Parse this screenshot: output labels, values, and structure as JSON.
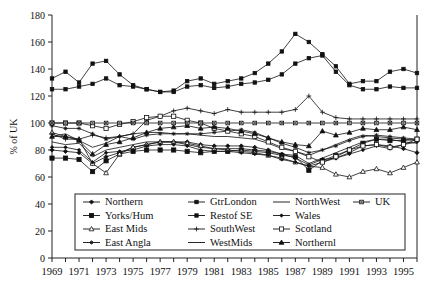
{
  "chart_data": {
    "type": "line",
    "title": "",
    "xlabel": "",
    "ylabel": "% of UK",
    "ylim": [
      0,
      180
    ],
    "ytick_step": 20,
    "yticks": [
      0,
      20,
      40,
      60,
      80,
      100,
      120,
      140,
      160,
      180
    ],
    "xlim": [
      1969,
      1996
    ],
    "xticks": [
      1969,
      1970,
      1971,
      1972,
      1973,
      1974,
      1975,
      1976,
      1977,
      1978,
      1979,
      1980,
      1981,
      1982,
      1983,
      1984,
      1985,
      1986,
      1987,
      1988,
      1989,
      1990,
      1991,
      1992,
      1993,
      1994,
      1995,
      1996
    ],
    "xtick_labels": [
      "1969",
      "",
      "1971",
      "",
      "1973",
      "",
      "1975",
      "",
      "1977",
      "",
      "1979",
      "",
      "1981",
      "",
      "1983",
      "",
      "1985",
      "",
      "1987",
      "",
      "1989",
      "",
      "1991",
      "",
      "1993",
      "",
      "1995",
      ""
    ],
    "x": [
      1969,
      1970,
      1971,
      1972,
      1973,
      1974,
      1975,
      1976,
      1977,
      1978,
      1979,
      1980,
      1981,
      1982,
      1983,
      1984,
      1985,
      1986,
      1987,
      1988,
      1989,
      1990,
      1991,
      1992,
      1993,
      1994,
      1995,
      1996
    ],
    "grid": false,
    "legend_position": "inside-bottom-center",
    "series": [
      {
        "name": "Northern",
        "marker": "diamond-filled",
        "values": [
          80,
          79,
          78,
          70,
          75,
          78,
          82,
          84,
          86,
          86,
          86,
          84,
          83,
          83,
          83,
          82,
          80,
          77,
          74,
          69,
          73,
          74,
          78,
          83,
          84,
          83,
          81,
          78
        ]
      },
      {
        "name": "Yorks/Hum",
        "marker": "square-filled",
        "values": [
          74,
          74,
          73,
          64,
          72,
          77,
          79,
          80,
          80,
          80,
          79,
          78,
          79,
          79,
          80,
          79,
          78,
          76,
          75,
          65,
          72,
          76,
          80,
          85,
          88,
          87,
          87,
          88
        ]
      },
      {
        "name": "East Mids",
        "marker": "triangle-open",
        "values": [
          93,
          90,
          88,
          70,
          63,
          77,
          82,
          84,
          86,
          86,
          85,
          83,
          81,
          80,
          79,
          78,
          76,
          74,
          71,
          68,
          67,
          62,
          60,
          64,
          66,
          63,
          67,
          71
        ]
      },
      {
        "name": "East Angla",
        "marker": "star",
        "values": [
          98,
          96,
          96,
          92,
          88,
          90,
          88,
          91,
          92,
          92,
          92,
          92,
          93,
          94,
          95,
          93,
          89,
          85,
          82,
          78,
          80,
          83,
          87,
          90,
          91,
          90,
          89,
          88
        ]
      },
      {
        "name": "GtrLondon",
        "marker": "square-filled-sm",
        "values": [
          133,
          138,
          130,
          144,
          146,
          136,
          128,
          125,
          123,
          124,
          131,
          133,
          129,
          131,
          133,
          137,
          144,
          153,
          166,
          160,
          151,
          142,
          129,
          131,
          131,
          138,
          140,
          137
        ]
      },
      {
        "name": "Restof SE",
        "marker": "square-filled-sm",
        "values": [
          125,
          125,
          127,
          129,
          133,
          128,
          127,
          125,
          123,
          123,
          127,
          128,
          126,
          127,
          129,
          130,
          132,
          136,
          144,
          148,
          150,
          138,
          128,
          125,
          125,
          127,
          126,
          126
        ]
      },
      {
        "name": "SouthWest",
        "marker": "plus",
        "values": [
          92,
          88,
          88,
          91,
          89,
          90,
          92,
          102,
          105,
          109,
          111,
          109,
          107,
          110,
          108,
          108,
          108,
          108,
          110,
          120,
          108,
          104,
          103,
          103,
          103,
          103,
          103,
          103
        ]
      },
      {
        "name": "WestMids",
        "marker": "none",
        "values": [
          90,
          92,
          87,
          82,
          85,
          90,
          92,
          93,
          93,
          92,
          92,
          91,
          90,
          90,
          89,
          88,
          85,
          81,
          79,
          76,
          80,
          84,
          88,
          91,
          90,
          89,
          88,
          87
        ]
      },
      {
        "name": "NorthWest",
        "marker": "none",
        "values": [
          86,
          84,
          85,
          75,
          80,
          82,
          84,
          86,
          86,
          86,
          84,
          82,
          81,
          81,
          81,
          80,
          79,
          77,
          76,
          70,
          74,
          78,
          82,
          86,
          88,
          88,
          86,
          85
        ]
      },
      {
        "name": "Wales",
        "marker": "diamond-filled-sm",
        "values": [
          82,
          82,
          80,
          71,
          78,
          79,
          80,
          83,
          84,
          84,
          83,
          80,
          79,
          79,
          78,
          77,
          76,
          73,
          71,
          68,
          71,
          74,
          77,
          80,
          83,
          81,
          84,
          86
        ]
      },
      {
        "name": "Scotland",
        "marker": "square-open",
        "values": [
          100,
          100,
          100,
          98,
          96,
          99,
          101,
          104,
          105,
          105,
          102,
          100,
          96,
          94,
          92,
          90,
          86,
          82,
          79,
          75,
          71,
          75,
          80,
          83,
          84,
          82,
          84,
          88
        ]
      },
      {
        "name": "Northernl",
        "marker": "triangle-filled",
        "values": [
          90,
          90,
          87,
          77,
          84,
          86,
          89,
          93,
          96,
          97,
          98,
          96,
          97,
          96,
          94,
          92,
          89,
          86,
          84,
          83,
          94,
          91,
          93,
          96,
          95,
          95,
          97,
          95
        ]
      },
      {
        "name": "UK",
        "marker": "cross-sq",
        "values": [
          100,
          100,
          100,
          100,
          100,
          100,
          100,
          100,
          100,
          100,
          100,
          100,
          100,
          100,
          100,
          100,
          100,
          100,
          100,
          100,
          100,
          100,
          100,
          100,
          100,
          100,
          100,
          100
        ]
      }
    ]
  },
  "legend": {
    "columns": [
      [
        {
          "label": "Northern",
          "marker": "diamond-filled"
        },
        {
          "label": "Yorks/Hum",
          "marker": "square-filled"
        },
        {
          "label": "East Mids",
          "marker": "triangle-open"
        },
        {
          "label": "East Angla",
          "marker": "star"
        }
      ],
      [
        {
          "label": "GtrLondon",
          "marker": "square-filled-sm"
        },
        {
          "label": "Restof SE",
          "marker": "square-filled-sm"
        },
        {
          "label": "SouthWest",
          "marker": "plus"
        },
        {
          "label": "WestMids",
          "marker": "none"
        }
      ],
      [
        {
          "label": "NorthWest",
          "marker": "none"
        },
        {
          "label": "Wales",
          "marker": "diamond-filled-sm"
        },
        {
          "label": "Scotland",
          "marker": "square-open"
        },
        {
          "label": "Northernl",
          "marker": "triangle-filled"
        }
      ],
      [
        {
          "label": "UK",
          "marker": "cross-sq"
        }
      ]
    ]
  },
  "colors": {
    "ink": "#111111",
    "background": "#ffffff"
  }
}
